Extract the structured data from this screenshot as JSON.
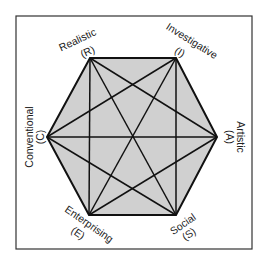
{
  "diagram": {
    "type": "hexagon",
    "colors": {
      "background": "#ffffff",
      "frame": "#333333",
      "fill": "#d0d0d0",
      "lines": "#111111",
      "text": "#222222"
    },
    "nodes": [
      {
        "id": "R",
        "name": "Realistic",
        "abbr": "(R)"
      },
      {
        "id": "I",
        "name": "Investigative",
        "abbr": "(I)"
      },
      {
        "id": "A",
        "name": "Artistic",
        "abbr": "(A)"
      },
      {
        "id": "S",
        "name": "Social",
        "abbr": "(S)"
      },
      {
        "id": "E",
        "name": "Enterprising",
        "abbr": "(E)"
      },
      {
        "id": "C",
        "name": "Conventional",
        "abbr": "(C)"
      }
    ],
    "edges": [
      [
        "R",
        "I"
      ],
      [
        "I",
        "A"
      ],
      [
        "A",
        "S"
      ],
      [
        "S",
        "E"
      ],
      [
        "E",
        "C"
      ],
      [
        "C",
        "R"
      ],
      [
        "R",
        "A"
      ],
      [
        "R",
        "S"
      ],
      [
        "R",
        "E"
      ],
      [
        "I",
        "S"
      ],
      [
        "I",
        "E"
      ],
      [
        "I",
        "C"
      ],
      [
        "A",
        "E"
      ],
      [
        "A",
        "C"
      ],
      [
        "S",
        "C"
      ]
    ]
  }
}
